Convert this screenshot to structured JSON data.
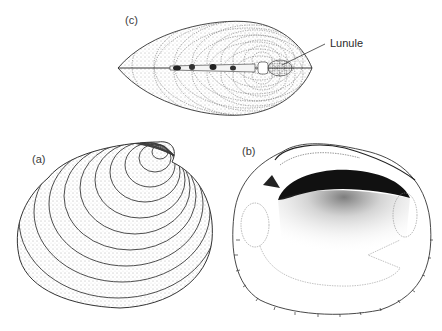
{
  "figure": {
    "panels": [
      {
        "id": "c",
        "label": "(c)",
        "view": "dorsal view of closed valves"
      },
      {
        "id": "a",
        "label": "(a)",
        "view": "external view of left valve"
      },
      {
        "id": "b",
        "label": "(b)",
        "view": "internal view of valve"
      }
    ],
    "annotations": [
      {
        "text": "Lunule",
        "points_to": "lunule region anterior to umbones in view (c)"
      }
    ],
    "caption": {
      "text": "",
      "note": "caption line is clipped at bottom edge and not legible"
    }
  },
  "style": {
    "ink": "#2a2a2a",
    "paper": "#ffffff",
    "stipple": "#555555"
  }
}
